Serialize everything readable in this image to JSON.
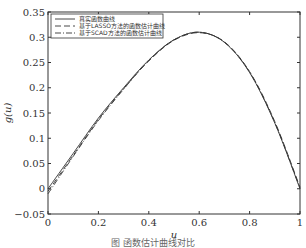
{
  "chart_data": {
    "type": "line",
    "title": "",
    "xlabel": "u",
    "ylabel": "g(u)",
    "xlim": [
      0,
      1
    ],
    "ylim": [
      -0.05,
      0.35
    ],
    "xticks": [
      "0",
      "0.2",
      "0.4",
      "0.6",
      "0.8",
      "1"
    ],
    "yticks": [
      "-0.05",
      "0",
      "0.05",
      "0.1",
      "0.15",
      "0.2",
      "0.25",
      "0.3",
      "0.35"
    ],
    "grid": false,
    "legend_position": "upper left",
    "x": [
      0,
      0.1,
      0.2,
      0.3,
      0.4,
      0.5,
      0.6,
      0.7,
      0.8,
      0.9,
      1.0
    ],
    "series": [
      {
        "name": "真实函数曲线",
        "style": "solid",
        "values": [
          0.0,
          0.07,
          0.14,
          0.2,
          0.255,
          0.295,
          0.31,
          0.29,
          0.23,
          0.13,
          0.0
        ]
      },
      {
        "name": "基于LASSO方法的函数估计曲线",
        "style": "dashed",
        "values": [
          -0.005,
          0.066,
          0.137,
          0.198,
          0.253,
          0.294,
          0.309,
          0.291,
          0.232,
          0.133,
          0.003
        ]
      },
      {
        "name": "基于SCAD方法的函数估计曲线",
        "style": "dashdot",
        "values": [
          -0.01,
          0.064,
          0.135,
          0.197,
          0.254,
          0.295,
          0.31,
          0.29,
          0.231,
          0.131,
          0.001
        ]
      }
    ]
  },
  "caption": "图 函数估计曲线对比"
}
